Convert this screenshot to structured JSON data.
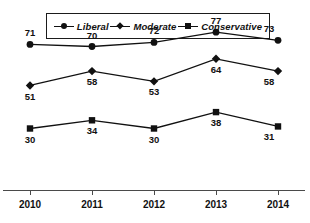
{
  "chart_data": {
    "type": "line",
    "title": "",
    "subtitle": "",
    "xlabel": "",
    "ylabel": "",
    "categories": [
      "2010",
      "2011",
      "2012",
      "2013",
      "2014"
    ],
    "series": [
      {
        "name": "Liberal",
        "marker": "circle",
        "values": [
          71,
          70,
          72,
          77,
          73
        ],
        "label_position": "above"
      },
      {
        "name": "Moderate",
        "marker": "diamond",
        "values": [
          51,
          58,
          53,
          64,
          58
        ],
        "label_position": "below"
      },
      {
        "name": "Conservative",
        "marker": "square",
        "values": [
          30,
          34,
          30,
          38,
          31
        ],
        "label_position": "below"
      }
    ],
    "ylim": [
      0,
      100
    ],
    "grid": false,
    "legend_position": "top",
    "colors": {
      "line": "#111111",
      "marker": "#111111",
      "axis": "#4a4a4a",
      "text": "#111111",
      "background": "#ffffff"
    }
  },
  "legend": {
    "items": [
      {
        "label": "Liberal",
        "marker": "circle"
      },
      {
        "label": "Moderate",
        "marker": "diamond"
      },
      {
        "label": "Conservative",
        "marker": "square"
      }
    ]
  },
  "axis": {
    "ticks": [
      "2010",
      "2011",
      "2012",
      "2013",
      "2014"
    ]
  },
  "labels": {
    "liberal": [
      "71",
      "70",
      "72",
      "77",
      "73"
    ],
    "moderate": [
      "51",
      "58",
      "53",
      "64",
      "58"
    ],
    "conservative": [
      "30",
      "34",
      "30",
      "38",
      "31"
    ]
  }
}
